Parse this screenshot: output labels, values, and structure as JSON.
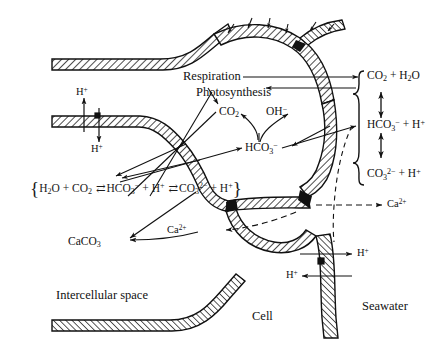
{
  "figure": {
    "type": "biological-cell-diagram",
    "title_visible": false,
    "domain_topic": "Carbon and calcium transport across cell membranes (calcification)",
    "background_color": "#ffffff",
    "ink_color": "#111111",
    "membrane_fill_pattern": "diagonal-hatch"
  },
  "regions": {
    "intercellular_space": "Intercellular space",
    "cell": "Cell",
    "seawater": "Seawater"
  },
  "processes": {
    "respiration": "Respiration",
    "photosynthesis": "Photosynthesis"
  },
  "species": {
    "co2": "CO",
    "co2_sub": "2",
    "oh_minus": "OH",
    "oh_sup": "−",
    "hco3": "HCO",
    "hco3_sub": "3",
    "hco3_sup": "−",
    "caco3": "CaCO",
    "caco3_sub": "3",
    "ca2plus": "Ca",
    "ca2plus_sup": "2+",
    "hplus": "H",
    "hplus_sup": "+"
  },
  "left_equilibrium": {
    "brace_open": "{",
    "brace_close": "}",
    "terms": [
      {
        "text": "H",
        "sub": "2",
        "text2": "O + CO",
        "sub2": "2"
      },
      {
        "text": "HCO",
        "sub": "3",
        "sup": "−",
        "plus": " + H",
        "plus_sup": "+"
      },
      {
        "text": "CO",
        "sub": "3",
        "sup": "2−",
        "plus": " + H",
        "plus_sup": "+"
      }
    ],
    "operator": "⇄",
    "full_text": "{H2O + CO2 ⇄ HCO3− + H+ ⇄ CO3 2− + H+}"
  },
  "right_equilibrium": {
    "brace": "{",
    "rows": [
      {
        "label": "CO",
        "sub": "2",
        "tail": " + H",
        "tail_sub": "2",
        "tail2": "O"
      },
      {
        "label": "HCO",
        "sub": "3",
        "sup": "−",
        "tail": " + H",
        "tail_sup": "+"
      },
      {
        "label": "CO",
        "sub": "3",
        "sup": "2−",
        "tail": " + H",
        "tail_sup": "+"
      }
    ],
    "vertical_operator": "double-headed-arrow",
    "full_text": "{ CO2 + H2O ↕ HCO3− + H+ ↕ CO3 2− + H+ }"
  },
  "flux_labels": {
    "hplus_upper_left_out": "H+",
    "hplus_upper_left_in": "H+",
    "ca_seawater_right": "Ca2+",
    "ca_into_cell": "Ca2+",
    "hplus_seawater_out": "H+",
    "hplus_seawater_in": "H+"
  },
  "arrow_styles": {
    "solid": "mass/flux transfer",
    "dashed": "calcium transport",
    "double_headed": "chemical equilibrium"
  }
}
